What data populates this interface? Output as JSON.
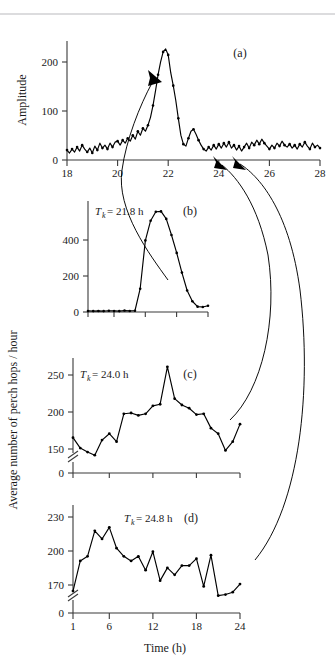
{
  "figure": {
    "y_axis_label_main": "Average number of perch hops / hour",
    "x_axis_label": "Time (h)",
    "top_rule": true
  },
  "chart_data": [
    {
      "type": "line",
      "panel": "(a)",
      "title": "",
      "xlabel": "",
      "ylabel": "Amplitude",
      "xlim": [
        18,
        28
      ],
      "ylim": [
        0,
        240
      ],
      "xticks": [
        18,
        20,
        22,
        24,
        26,
        28
      ],
      "xticklabels": [
        "18",
        "20",
        "22",
        "24",
        "26",
        "28"
      ],
      "yticks": [
        0,
        100,
        200
      ],
      "yticklabels": [
        "0",
        "100",
        "200"
      ],
      "grid": false,
      "legend": "none",
      "markers": true,
      "x": [
        18.0,
        18.1,
        18.2,
        18.3,
        18.4,
        18.5,
        18.6,
        18.7,
        18.8,
        18.9,
        19.0,
        19.1,
        19.2,
        19.3,
        19.4,
        19.5,
        19.6,
        19.7,
        19.8,
        19.9,
        20.0,
        20.1,
        20.2,
        20.3,
        20.4,
        20.5,
        20.6,
        20.7,
        20.8,
        20.9,
        21.0,
        21.1,
        21.2,
        21.3,
        21.4,
        21.5,
        21.6,
        21.7,
        21.8,
        21.9,
        22.0,
        22.1,
        22.2,
        22.3,
        22.4,
        22.5,
        22.6,
        22.7,
        22.8,
        22.9,
        23.0,
        23.1,
        23.2,
        23.3,
        23.4,
        23.5,
        23.6,
        23.7,
        23.8,
        23.9,
        24.0,
        24.1,
        24.2,
        24.3,
        24.4,
        24.5,
        24.6,
        24.7,
        24.8,
        24.9,
        25.0,
        25.1,
        25.2,
        25.3,
        25.4,
        25.5,
        25.6,
        25.7,
        25.8,
        25.9,
        26.0,
        26.1,
        26.2,
        26.3,
        26.4,
        26.5,
        26.6,
        26.7,
        26.8,
        26.9,
        27.0,
        27.1,
        27.2,
        27.3,
        27.4,
        27.5,
        27.6,
        27.7,
        27.8,
        27.9,
        28.0
      ],
      "values": [
        20,
        14,
        22,
        16,
        26,
        18,
        30,
        22,
        16,
        24,
        14,
        28,
        20,
        34,
        24,
        30,
        22,
        34,
        26,
        36,
        38,
        30,
        40,
        34,
        44,
        38,
        50,
        42,
        58,
        50,
        64,
        58,
        70,
        86,
        110,
        140,
        172,
        198,
        218,
        224,
        212,
        176,
        150,
        120,
        84,
        50,
        32,
        28,
        44,
        58,
        62,
        52,
        40,
        30,
        22,
        18,
        26,
        20,
        30,
        22,
        32,
        24,
        34,
        26,
        36,
        24,
        30,
        20,
        28,
        18,
        26,
        34,
        24,
        36,
        30,
        40,
        32,
        42,
        34,
        28,
        22,
        30,
        24,
        34,
        28,
        38,
        30,
        26,
        32,
        24,
        30,
        22,
        32,
        26,
        36,
        28,
        22,
        34,
        26,
        30,
        24
      ]
    },
    {
      "type": "line",
      "panel": "(b)",
      "annotation": "T_k = 21.8 h",
      "annotation_symbol": "T",
      "annotation_sub": "k",
      "annotation_value": "= 21.8 h",
      "xlabel": "",
      "ylabel": "",
      "xlim": [
        1,
        24
      ],
      "ylim": [
        0,
        620
      ],
      "xticks": [
        1,
        6,
        12,
        18,
        24
      ],
      "xticklabels": [
        "",
        "",
        "",
        "",
        ""
      ],
      "yticks": [
        0,
        200,
        400
      ],
      "yticklabels": [
        "0",
        "200",
        "400"
      ],
      "grid": false,
      "legend": "none",
      "markers": true,
      "x": [
        1,
        2,
        3,
        4,
        5,
        6,
        7,
        8,
        9,
        10,
        11,
        12,
        13,
        14,
        15,
        16,
        17,
        18,
        19,
        20,
        21,
        22,
        23,
        24
      ],
      "values": [
        6,
        5,
        6,
        5,
        7,
        6,
        5,
        8,
        6,
        7,
        130,
        400,
        510,
        560,
        562,
        520,
        430,
        330,
        220,
        120,
        60,
        30,
        28,
        35
      ]
    },
    {
      "type": "line",
      "panel": "(c)",
      "annotation": "T_k = 24.0 h",
      "annotation_symbol": "T",
      "annotation_sub": "k",
      "annotation_value": "= 24.0 h",
      "xlabel": "",
      "ylabel": "",
      "xlim": [
        1,
        24
      ],
      "ylim": [
        140,
        270
      ],
      "yticks": [
        0,
        150,
        200,
        250
      ],
      "yticklabels": [
        "0",
        "150",
        "200",
        "250"
      ],
      "xticks": [
        1,
        6,
        12,
        18,
        24
      ],
      "xticklabels": [
        "",
        "",
        "",
        "",
        ""
      ],
      "axis_break": true,
      "grid": false,
      "legend": "none",
      "markers": true,
      "x": [
        1,
        2,
        3,
        4,
        5,
        6,
        7,
        8,
        9,
        10,
        11,
        12,
        13,
        14,
        15,
        16,
        17,
        18,
        19,
        20,
        21,
        22,
        23,
        24
      ],
      "values": [
        173,
        160,
        155,
        151,
        170,
        178,
        168,
        203,
        204,
        201,
        203,
        213,
        215,
        262,
        222,
        214,
        210,
        202,
        203,
        185,
        178,
        157,
        168,
        190
      ]
    },
    {
      "type": "line",
      "panel": "(d)",
      "annotation": "T_k = 24.8 h",
      "annotation_symbol": "T",
      "annotation_sub": "k",
      "annotation_value": "= 24.8 h",
      "xlabel": "Time (h)",
      "ylabel": "",
      "xlim": [
        1,
        24
      ],
      "ylim": [
        160,
        240
      ],
      "yticks": [
        0,
        170,
        200,
        230
      ],
      "yticklabels": [
        "0",
        "170",
        "200",
        "230"
      ],
      "xticks": [
        1,
        6,
        12,
        18,
        24
      ],
      "xticklabels": [
        "1",
        "6",
        "12",
        "18",
        "24"
      ],
      "axis_break": true,
      "grid": false,
      "legend": "none",
      "markers": true,
      "x": [
        1,
        2,
        3,
        4,
        5,
        6,
        7,
        8,
        9,
        10,
        11,
        12,
        13,
        14,
        15,
        16,
        17,
        18,
        19,
        20,
        21,
        22,
        23,
        24
      ],
      "values": [
        166,
        192,
        196,
        218,
        211,
        221,
        203,
        196,
        192,
        196,
        184,
        200,
        175,
        186,
        180,
        188,
        188,
        194,
        170,
        197,
        162,
        163,
        165,
        172
      ]
    }
  ],
  "annotations": {
    "arrow_a_peak": "arrow from panel b to panel a peak at 21.8 h",
    "arrow_a_24": "arrow from panel c to panel a at 24.0 h",
    "arrow_a_248": "arrow from panel d to panel a at 24.8 h"
  },
  "panel_labels": {
    "a": "(a)",
    "b": "(b)",
    "c": "(c)",
    "d": "(d)"
  },
  "tick_labels": {
    "a_y": [
      "0",
      "100",
      "200"
    ],
    "a_x": [
      "18",
      "20",
      "22",
      "24",
      "26",
      "28"
    ],
    "b_y": [
      "0",
      "200",
      "400"
    ],
    "c_y": [
      "0",
      "150",
      "200",
      "250"
    ],
    "d_y": [
      "0",
      "170",
      "200",
      "230"
    ],
    "d_x": [
      "1",
      "6",
      "12",
      "18",
      "24"
    ]
  },
  "colors": {
    "ink": "#000000",
    "axis": "#3a3a3a",
    "rule": "#b9b9bd",
    "background": "#ffffff"
  }
}
